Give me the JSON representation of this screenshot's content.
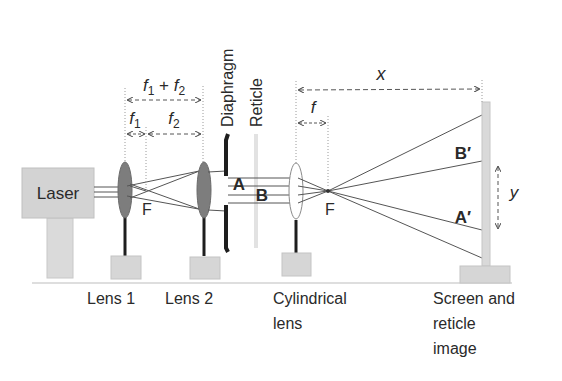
{
  "diagram": {
    "type": "optical-setup",
    "components": {
      "laser": {
        "label": "Laser"
      },
      "lens1": {
        "label": "Lens 1"
      },
      "lens2": {
        "label": "Lens 2"
      },
      "diaphragm": {
        "label": "Diaphragm"
      },
      "reticle": {
        "label": "Reticle"
      },
      "cylindrical_lens": {
        "label_line1": "Cylindrical",
        "label_line2": "lens"
      },
      "screen": {
        "label_line1": "Screen and",
        "label_line2": "reticle",
        "label_line3": "image"
      }
    },
    "focal_points": {
      "f_after_lens1": "F",
      "f_after_cyl": "F"
    },
    "dimensions": {
      "f1_plus_f2": {
        "base1": "f",
        "sub1": "1",
        "plus": " + ",
        "base2": "f",
        "sub2": "2"
      },
      "f1": {
        "base": "f",
        "sub": "1"
      },
      "f2": {
        "base": "f",
        "sub": "2"
      },
      "f": "f",
      "x": "x",
      "y": "y"
    },
    "beam_labels": {
      "A": "A",
      "B": "B",
      "A_prime": "A′",
      "B_prime": "B′"
    },
    "colors": {
      "gray_box": "#d6d6d6",
      "lens_dark": "#7d7d7d",
      "post": "#1e1e1e",
      "beam": "#555555",
      "reticle": "#e2e2e2",
      "dashed": "#8a8a8a"
    }
  }
}
